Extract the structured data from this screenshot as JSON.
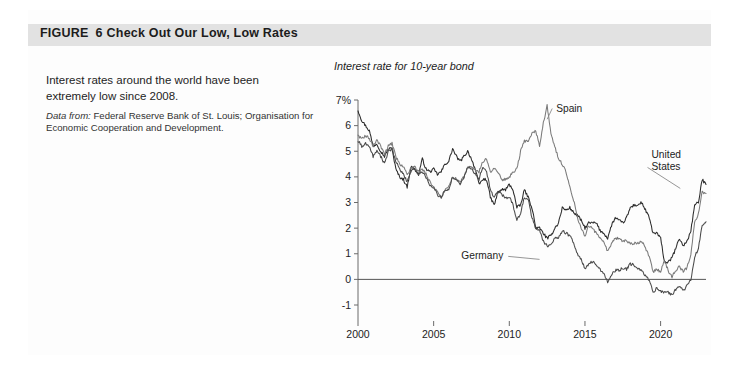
{
  "figure": {
    "label": "FIGURE",
    "number": "6",
    "title": "Check Out Our Low, Low Rates"
  },
  "blurb": {
    "line1": "Interest rates around the world have been",
    "line2": "extremely low since 2008.",
    "source_label": "Data from:",
    "source_text": "Federal Reserve Bank of St. Louis; Organisation for Economic Cooperation and Development."
  },
  "colors": {
    "header_band": "#e2e2e2",
    "axis": "#6b6b6b",
    "spain": "#7a7a7a",
    "united_states": "#2b2b2b",
    "germany": "#4a4a4a",
    "leader": "#8a8a8a"
  },
  "chart_data": {
    "type": "line",
    "title": "Interest rate for 10-year bond",
    "xlabel": "",
    "ylabel": "",
    "xlim": [
      2000,
      2023
    ],
    "ylim": [
      -1,
      7
    ],
    "grid": false,
    "legend_position": "inline-annotations",
    "ytick_labels": [
      "7%",
      "6",
      "5",
      "4",
      "3",
      "2",
      "1",
      "0",
      "-1"
    ],
    "ytick_values": [
      7,
      6,
      5,
      4,
      3,
      2,
      1,
      0,
      -1
    ],
    "xtick_labels": [
      "2000",
      "2005",
      "2010",
      "2015",
      "2020"
    ],
    "xtick_values": [
      2000,
      2005,
      2010,
      2015,
      2020
    ],
    "zero_line": 0,
    "annotations": [
      {
        "label": "Spain",
        "x": 2013.1,
        "y": 6.55
      },
      {
        "label": "United States",
        "x": 2019.4,
        "y": 4.72
      },
      {
        "label": "Germany",
        "x": 2009.6,
        "y": 0.78
      }
    ],
    "x": [
      2000.0,
      2000.25,
      2000.5,
      2000.75,
      2001.0,
      2001.25,
      2001.5,
      2001.75,
      2002.0,
      2002.25,
      2002.5,
      2002.75,
      2003.0,
      2003.25,
      2003.5,
      2003.75,
      2004.0,
      2004.25,
      2004.5,
      2004.75,
      2005.0,
      2005.25,
      2005.5,
      2005.75,
      2006.0,
      2006.25,
      2006.5,
      2006.75,
      2007.0,
      2007.25,
      2007.5,
      2007.75,
      2008.0,
      2008.25,
      2008.5,
      2008.75,
      2009.0,
      2009.25,
      2009.5,
      2009.75,
      2010.0,
      2010.25,
      2010.5,
      2010.75,
      2011.0,
      2011.25,
      2011.5,
      2011.75,
      2012.0,
      2012.25,
      2012.5,
      2012.75,
      2013.0,
      2013.25,
      2013.5,
      2013.75,
      2014.0,
      2014.25,
      2014.5,
      2014.75,
      2015.0,
      2015.25,
      2015.5,
      2015.75,
      2016.0,
      2016.25,
      2016.5,
      2016.75,
      2017.0,
      2017.25,
      2017.5,
      2017.75,
      2018.0,
      2018.25,
      2018.5,
      2018.75,
      2019.0,
      2019.25,
      2019.5,
      2019.75,
      2020.0,
      2020.25,
      2020.5,
      2020.75,
      2021.0,
      2021.25,
      2021.5,
      2021.75,
      2022.0,
      2022.25,
      2022.5,
      2022.75,
      2023.0
    ],
    "series": [
      {
        "name": "United States",
        "color": "#2b2b2b",
        "values": [
          6.6,
          6.2,
          6.0,
          5.8,
          5.2,
          5.3,
          5.0,
          4.8,
          5.1,
          5.1,
          4.3,
          4.0,
          3.9,
          3.6,
          4.4,
          4.3,
          4.1,
          4.7,
          4.3,
          4.2,
          4.3,
          4.1,
          4.2,
          4.5,
          4.6,
          5.1,
          4.8,
          4.6,
          4.8,
          5.0,
          4.7,
          4.3,
          3.7,
          3.9,
          3.9,
          3.2,
          2.9,
          3.4,
          3.5,
          3.5,
          3.7,
          3.5,
          2.8,
          2.9,
          3.5,
          3.2,
          2.8,
          2.0,
          2.0,
          1.8,
          1.6,
          1.7,
          2.0,
          2.2,
          2.8,
          2.7,
          2.8,
          2.6,
          2.5,
          2.3,
          2.0,
          2.2,
          2.2,
          2.2,
          1.9,
          1.8,
          1.6,
          2.1,
          2.4,
          2.3,
          2.2,
          2.4,
          2.8,
          2.9,
          2.9,
          3.0,
          2.7,
          2.4,
          1.8,
          1.8,
          1.6,
          0.7,
          0.65,
          0.85,
          1.2,
          1.6,
          1.3,
          1.5,
          1.9,
          2.9,
          3.0,
          3.9,
          3.7
        ]
      },
      {
        "name": "Spain",
        "color": "#7a7a7a",
        "values": [
          5.6,
          5.5,
          5.6,
          5.5,
          5.2,
          5.4,
          5.2,
          4.9,
          5.2,
          5.3,
          4.8,
          4.5,
          4.4,
          4.1,
          4.3,
          4.4,
          4.2,
          4.3,
          4.1,
          3.8,
          3.6,
          3.4,
          3.2,
          3.5,
          3.6,
          4.0,
          3.9,
          3.8,
          4.0,
          4.4,
          4.4,
          4.3,
          4.2,
          4.6,
          4.7,
          4.2,
          4.3,
          4.2,
          3.9,
          3.9,
          4.0,
          4.2,
          4.3,
          5.0,
          5.4,
          5.4,
          5.7,
          5.8,
          5.2,
          6.1,
          6.8,
          5.7,
          5.2,
          4.7,
          4.5,
          4.2,
          3.6,
          3.1,
          2.4,
          2.0,
          1.7,
          2.1,
          2.0,
          1.8,
          1.6,
          1.5,
          1.1,
          1.4,
          1.6,
          1.6,
          1.5,
          1.5,
          1.4,
          1.4,
          1.4,
          1.5,
          1.2,
          0.9,
          0.3,
          0.4,
          0.3,
          0.75,
          0.35,
          0.1,
          0.35,
          0.5,
          0.3,
          0.45,
          1.0,
          2.2,
          2.6,
          3.4,
          3.35
        ]
      },
      {
        "name": "Germany",
        "color": "#4a4a4a",
        "values": [
          5.4,
          5.2,
          5.3,
          5.2,
          4.8,
          5.0,
          4.8,
          4.5,
          5.0,
          5.1,
          4.6,
          4.3,
          4.1,
          3.8,
          4.2,
          4.3,
          4.1,
          4.2,
          4.0,
          3.7,
          3.6,
          3.3,
          3.2,
          3.5,
          3.5,
          4.0,
          3.9,
          3.7,
          4.0,
          4.4,
          4.3,
          4.1,
          3.9,
          4.4,
          4.2,
          3.5,
          3.2,
          3.4,
          3.3,
          3.2,
          3.2,
          2.9,
          2.3,
          2.6,
          3.2,
          3.1,
          2.4,
          2.0,
          1.9,
          1.5,
          1.3,
          1.4,
          1.6,
          1.6,
          1.9,
          1.8,
          1.7,
          1.4,
          1.0,
          0.8,
          0.4,
          0.6,
          0.7,
          0.6,
          0.4,
          0.2,
          -0.1,
          0.2,
          0.35,
          0.35,
          0.45,
          0.4,
          0.6,
          0.55,
          0.4,
          0.35,
          0.15,
          -0.05,
          -0.5,
          -0.35,
          -0.45,
          -0.5,
          -0.5,
          -0.6,
          -0.4,
          -0.25,
          -0.45,
          -0.25,
          0.0,
          0.9,
          1.2,
          2.1,
          2.25
        ]
      }
    ]
  }
}
